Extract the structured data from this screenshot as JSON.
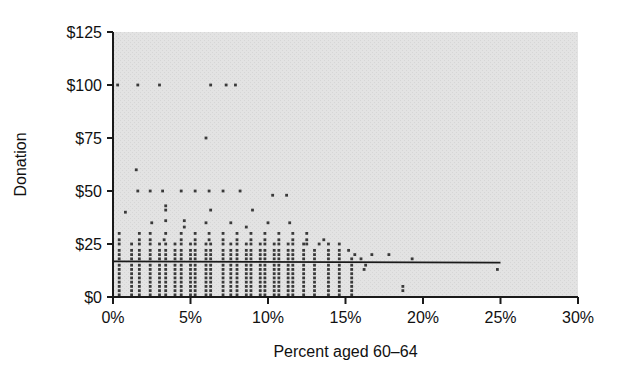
{
  "chart_data": {
    "type": "scatter",
    "title": "",
    "xlabel": "Percent aged 60–64",
    "ylabel": "Donation",
    "xlim": [
      0,
      30
    ],
    "ylim": [
      0,
      125
    ],
    "grid": false,
    "legend": "none",
    "xticks": [
      0,
      5,
      10,
      15,
      20,
      25,
      30
    ],
    "xticklabels": [
      "0%",
      "5%",
      "10%",
      "15%",
      "20%",
      "25%",
      "30%"
    ],
    "yticks": [
      0,
      25,
      50,
      75,
      100,
      125
    ],
    "yticklabels": [
      "$0",
      "$25",
      "$50",
      "$75",
      "$100",
      "$125"
    ],
    "plot_background": "#e3e3e3",
    "point_color": "#3a3a3a",
    "axis_color": "#1a1a1a",
    "trendline": {
      "label": "regression line",
      "color": "#1a1a1a",
      "x": [
        0.0,
        25.0
      ],
      "y": [
        16.8,
        16.2
      ]
    },
    "points": [
      [
        0.3,
        100
      ],
      [
        1.6,
        100
      ],
      [
        3.0,
        100
      ],
      [
        6.3,
        100
      ],
      [
        7.3,
        100
      ],
      [
        7.9,
        100
      ],
      [
        6.0,
        75
      ],
      [
        1.5,
        60
      ],
      [
        1.6,
        50
      ],
      [
        2.4,
        50
      ],
      [
        3.2,
        50
      ],
      [
        4.4,
        50
      ],
      [
        5.3,
        50
      ],
      [
        6.2,
        50
      ],
      [
        7.1,
        50
      ],
      [
        8.2,
        50
      ],
      [
        10.3,
        48
      ],
      [
        11.2,
        48
      ],
      [
        0.8,
        40
      ],
      [
        3.4,
        43
      ],
      [
        3.4,
        41
      ],
      [
        6.3,
        41
      ],
      [
        9.0,
        41
      ],
      [
        2.5,
        35
      ],
      [
        3.4,
        36
      ],
      [
        4.6,
        36
      ],
      [
        4.6,
        33
      ],
      [
        6.0,
        35
      ],
      [
        7.6,
        35
      ],
      [
        8.6,
        33
      ],
      [
        10.0,
        35
      ],
      [
        11.4,
        35
      ],
      [
        0.4,
        30
      ],
      [
        1.7,
        30
      ],
      [
        2.4,
        30
      ],
      [
        3.4,
        30
      ],
      [
        4.4,
        30
      ],
      [
        5.3,
        30
      ],
      [
        6.2,
        30
      ],
      [
        7.1,
        30
      ],
      [
        8.0,
        30
      ],
      [
        8.9,
        30
      ],
      [
        9.8,
        30
      ],
      [
        10.7,
        30
      ],
      [
        11.6,
        30
      ],
      [
        12.5,
        30
      ],
      [
        0.4,
        27
      ],
      [
        1.7,
        27
      ],
      [
        2.4,
        27
      ],
      [
        3.3,
        27
      ],
      [
        4.4,
        27
      ],
      [
        5.3,
        27
      ],
      [
        6.2,
        27
      ],
      [
        7.1,
        27
      ],
      [
        8.0,
        27
      ],
      [
        8.9,
        27
      ],
      [
        9.8,
        27
      ],
      [
        10.7,
        27
      ],
      [
        11.6,
        27
      ],
      [
        12.5,
        27
      ],
      [
        13.6,
        27
      ],
      [
        0.4,
        25
      ],
      [
        1.2,
        25
      ],
      [
        1.7,
        25
      ],
      [
        2.4,
        25
      ],
      [
        3.0,
        25
      ],
      [
        3.4,
        25
      ],
      [
        4.0,
        25
      ],
      [
        4.4,
        25
      ],
      [
        5.0,
        25
      ],
      [
        5.3,
        25
      ],
      [
        6.0,
        25
      ],
      [
        6.3,
        25
      ],
      [
        7.1,
        25
      ],
      [
        7.6,
        25
      ],
      [
        8.0,
        25
      ],
      [
        8.6,
        25
      ],
      [
        8.9,
        25
      ],
      [
        9.5,
        25
      ],
      [
        9.8,
        25
      ],
      [
        10.4,
        25
      ],
      [
        10.7,
        25
      ],
      [
        11.3,
        25
      ],
      [
        11.6,
        25
      ],
      [
        12.3,
        25
      ],
      [
        12.5,
        25
      ],
      [
        13.3,
        25
      ],
      [
        13.9,
        25
      ],
      [
        14.6,
        25
      ],
      [
        0.4,
        22
      ],
      [
        1.2,
        22
      ],
      [
        1.7,
        22
      ],
      [
        2.4,
        22
      ],
      [
        3.0,
        22
      ],
      [
        3.4,
        22
      ],
      [
        4.0,
        22
      ],
      [
        4.4,
        22
      ],
      [
        5.0,
        22
      ],
      [
        5.3,
        22
      ],
      [
        6.0,
        22
      ],
      [
        6.3,
        22
      ],
      [
        7.1,
        22
      ],
      [
        7.6,
        22
      ],
      [
        8.0,
        22
      ],
      [
        8.6,
        22
      ],
      [
        8.9,
        22
      ],
      [
        9.5,
        22
      ],
      [
        9.8,
        22
      ],
      [
        10.4,
        22
      ],
      [
        10.7,
        22
      ],
      [
        11.3,
        22
      ],
      [
        11.6,
        22
      ],
      [
        12.3,
        22
      ],
      [
        13.0,
        22
      ],
      [
        13.9,
        22
      ],
      [
        14.6,
        22
      ],
      [
        15.2,
        22
      ],
      [
        0.4,
        20
      ],
      [
        1.2,
        20
      ],
      [
        1.7,
        20
      ],
      [
        2.4,
        20
      ],
      [
        3.0,
        20
      ],
      [
        3.4,
        20
      ],
      [
        4.0,
        20
      ],
      [
        4.4,
        20
      ],
      [
        5.0,
        20
      ],
      [
        5.3,
        20
      ],
      [
        6.0,
        20
      ],
      [
        6.3,
        20
      ],
      [
        7.1,
        20
      ],
      [
        7.6,
        20
      ],
      [
        8.0,
        20
      ],
      [
        8.6,
        20
      ],
      [
        8.9,
        20
      ],
      [
        9.5,
        20
      ],
      [
        9.8,
        20
      ],
      [
        10.4,
        20
      ],
      [
        10.7,
        20
      ],
      [
        11.3,
        20
      ],
      [
        11.6,
        20
      ],
      [
        12.3,
        20
      ],
      [
        13.0,
        20
      ],
      [
        13.9,
        20
      ],
      [
        14.6,
        20
      ],
      [
        15.6,
        20
      ],
      [
        16.7,
        20
      ],
      [
        17.8,
        20
      ],
      [
        0.4,
        18
      ],
      [
        1.2,
        18
      ],
      [
        1.7,
        18
      ],
      [
        2.4,
        18
      ],
      [
        3.0,
        18
      ],
      [
        3.4,
        18
      ],
      [
        4.0,
        18
      ],
      [
        4.4,
        18
      ],
      [
        5.0,
        18
      ],
      [
        5.3,
        18
      ],
      [
        6.0,
        18
      ],
      [
        6.3,
        18
      ],
      [
        7.1,
        18
      ],
      [
        7.6,
        18
      ],
      [
        8.0,
        18
      ],
      [
        8.6,
        18
      ],
      [
        8.9,
        18
      ],
      [
        9.5,
        18
      ],
      [
        9.8,
        18
      ],
      [
        10.4,
        18
      ],
      [
        10.7,
        18
      ],
      [
        11.3,
        18
      ],
      [
        11.6,
        18
      ],
      [
        12.3,
        18
      ],
      [
        13.0,
        18
      ],
      [
        13.9,
        18
      ],
      [
        14.6,
        18
      ],
      [
        15.4,
        18
      ],
      [
        16.0,
        18
      ],
      [
        19.3,
        18
      ],
      [
        0.4,
        15
      ],
      [
        1.2,
        15
      ],
      [
        1.7,
        15
      ],
      [
        2.4,
        15
      ],
      [
        3.0,
        15
      ],
      [
        3.4,
        15
      ],
      [
        4.0,
        15
      ],
      [
        4.4,
        15
      ],
      [
        5.0,
        15
      ],
      [
        5.3,
        15
      ],
      [
        6.0,
        15
      ],
      [
        6.3,
        15
      ],
      [
        7.1,
        15
      ],
      [
        7.6,
        15
      ],
      [
        8.0,
        15
      ],
      [
        8.6,
        15
      ],
      [
        8.9,
        15
      ],
      [
        9.5,
        15
      ],
      [
        9.8,
        15
      ],
      [
        10.4,
        15
      ],
      [
        10.7,
        15
      ],
      [
        11.3,
        15
      ],
      [
        11.6,
        15
      ],
      [
        12.3,
        15
      ],
      [
        13.0,
        15
      ],
      [
        13.9,
        15
      ],
      [
        14.6,
        15
      ],
      [
        15.4,
        15
      ],
      [
        16.3,
        15
      ],
      [
        0.4,
        13
      ],
      [
        1.2,
        13
      ],
      [
        1.7,
        13
      ],
      [
        2.4,
        13
      ],
      [
        3.0,
        13
      ],
      [
        3.4,
        13
      ],
      [
        4.0,
        13
      ],
      [
        4.4,
        13
      ],
      [
        5.0,
        13
      ],
      [
        5.3,
        13
      ],
      [
        6.0,
        13
      ],
      [
        6.3,
        13
      ],
      [
        7.1,
        13
      ],
      [
        7.6,
        13
      ],
      [
        8.0,
        13
      ],
      [
        8.6,
        13
      ],
      [
        8.9,
        13
      ],
      [
        9.5,
        13
      ],
      [
        9.8,
        13
      ],
      [
        10.4,
        13
      ],
      [
        10.7,
        13
      ],
      [
        11.3,
        13
      ],
      [
        11.6,
        13
      ],
      [
        12.3,
        13
      ],
      [
        13.0,
        13
      ],
      [
        13.9,
        13
      ],
      [
        14.6,
        13
      ],
      [
        15.4,
        13
      ],
      [
        16.2,
        13
      ],
      [
        24.8,
        13
      ],
      [
        0.4,
        11
      ],
      [
        1.2,
        11
      ],
      [
        1.7,
        11
      ],
      [
        2.4,
        11
      ],
      [
        3.0,
        11
      ],
      [
        3.4,
        11
      ],
      [
        4.0,
        11
      ],
      [
        4.4,
        11
      ],
      [
        5.0,
        11
      ],
      [
        5.3,
        11
      ],
      [
        6.0,
        11
      ],
      [
        6.3,
        11
      ],
      [
        7.1,
        11
      ],
      [
        7.6,
        11
      ],
      [
        8.0,
        11
      ],
      [
        8.6,
        11
      ],
      [
        8.9,
        11
      ],
      [
        9.5,
        11
      ],
      [
        9.8,
        11
      ],
      [
        10.4,
        11
      ],
      [
        10.7,
        11
      ],
      [
        11.3,
        11
      ],
      [
        11.6,
        11
      ],
      [
        12.3,
        11
      ],
      [
        13.0,
        11
      ],
      [
        13.9,
        11
      ],
      [
        14.6,
        11
      ],
      [
        15.4,
        11
      ],
      [
        0.4,
        9
      ],
      [
        1.2,
        9
      ],
      [
        1.7,
        9
      ],
      [
        2.4,
        9
      ],
      [
        3.0,
        9
      ],
      [
        3.4,
        9
      ],
      [
        4.0,
        9
      ],
      [
        4.4,
        9
      ],
      [
        5.0,
        9
      ],
      [
        5.3,
        9
      ],
      [
        6.0,
        9
      ],
      [
        6.3,
        9
      ],
      [
        7.1,
        9
      ],
      [
        7.6,
        9
      ],
      [
        8.0,
        9
      ],
      [
        8.6,
        9
      ],
      [
        8.9,
        9
      ],
      [
        9.5,
        9
      ],
      [
        9.8,
        9
      ],
      [
        10.4,
        9
      ],
      [
        10.7,
        9
      ],
      [
        11.3,
        9
      ],
      [
        11.6,
        9
      ],
      [
        12.3,
        9
      ],
      [
        13.0,
        9
      ],
      [
        13.9,
        9
      ],
      [
        14.6,
        9
      ],
      [
        15.4,
        9
      ],
      [
        0.4,
        7
      ],
      [
        1.2,
        7
      ],
      [
        1.7,
        7
      ],
      [
        2.4,
        7
      ],
      [
        3.0,
        7
      ],
      [
        3.4,
        7
      ],
      [
        4.0,
        7
      ],
      [
        4.4,
        7
      ],
      [
        5.0,
        7
      ],
      [
        5.3,
        7
      ],
      [
        6.0,
        7
      ],
      [
        6.3,
        7
      ],
      [
        7.1,
        7
      ],
      [
        7.6,
        7
      ],
      [
        8.0,
        7
      ],
      [
        8.6,
        7
      ],
      [
        8.9,
        7
      ],
      [
        9.5,
        7
      ],
      [
        9.8,
        7
      ],
      [
        10.4,
        7
      ],
      [
        10.7,
        7
      ],
      [
        11.3,
        7
      ],
      [
        11.6,
        7
      ],
      [
        12.3,
        7
      ],
      [
        13.0,
        7
      ],
      [
        13.9,
        7
      ],
      [
        14.6,
        7
      ],
      [
        15.4,
        7
      ],
      [
        0.4,
        5
      ],
      [
        1.2,
        5
      ],
      [
        1.7,
        5
      ],
      [
        2.4,
        5
      ],
      [
        3.0,
        5
      ],
      [
        3.4,
        5
      ],
      [
        4.0,
        5
      ],
      [
        4.4,
        5
      ],
      [
        5.0,
        5
      ],
      [
        5.3,
        5
      ],
      [
        6.0,
        5
      ],
      [
        6.3,
        5
      ],
      [
        7.1,
        5
      ],
      [
        7.6,
        5
      ],
      [
        8.0,
        5
      ],
      [
        8.6,
        5
      ],
      [
        8.9,
        5
      ],
      [
        9.5,
        5
      ],
      [
        9.8,
        5
      ],
      [
        10.4,
        5
      ],
      [
        10.7,
        5
      ],
      [
        11.3,
        5
      ],
      [
        11.6,
        5
      ],
      [
        12.3,
        5
      ],
      [
        13.0,
        5
      ],
      [
        13.9,
        5
      ],
      [
        14.6,
        5
      ],
      [
        15.4,
        5
      ],
      [
        18.7,
        5
      ],
      [
        0.4,
        3
      ],
      [
        1.2,
        3
      ],
      [
        1.7,
        3
      ],
      [
        2.4,
        3
      ],
      [
        3.0,
        3
      ],
      [
        3.4,
        3
      ],
      [
        4.0,
        3
      ],
      [
        4.4,
        3
      ],
      [
        5.0,
        3
      ],
      [
        5.3,
        3
      ],
      [
        6.0,
        3
      ],
      [
        6.3,
        3
      ],
      [
        7.1,
        3
      ],
      [
        7.6,
        3
      ],
      [
        8.0,
        3
      ],
      [
        8.6,
        3
      ],
      [
        8.9,
        3
      ],
      [
        9.5,
        3
      ],
      [
        9.8,
        3
      ],
      [
        10.4,
        3
      ],
      [
        10.7,
        3
      ],
      [
        11.3,
        3
      ],
      [
        11.6,
        3
      ],
      [
        12.3,
        3
      ],
      [
        13.0,
        3
      ],
      [
        13.9,
        3
      ],
      [
        14.6,
        3
      ],
      [
        15.4,
        3
      ],
      [
        18.7,
        3
      ],
      [
        0.4,
        1
      ],
      [
        1.2,
        1
      ],
      [
        1.7,
        1
      ],
      [
        2.4,
        1
      ],
      [
        3.0,
        1
      ],
      [
        3.4,
        1
      ],
      [
        4.0,
        1
      ],
      [
        4.4,
        1
      ],
      [
        5.0,
        1
      ],
      [
        5.3,
        1
      ],
      [
        6.0,
        1
      ],
      [
        6.3,
        1
      ],
      [
        7.1,
        1
      ],
      [
        7.6,
        1
      ],
      [
        8.0,
        1
      ],
      [
        8.6,
        1
      ],
      [
        8.9,
        1
      ],
      [
        9.5,
        1
      ],
      [
        9.8,
        1
      ],
      [
        10.4,
        1
      ],
      [
        10.7,
        1
      ],
      [
        11.3,
        1
      ],
      [
        11.6,
        1
      ],
      [
        12.3,
        1
      ],
      [
        13.0,
        1
      ],
      [
        13.9,
        1
      ],
      [
        14.6,
        1
      ],
      [
        15.4,
        1
      ]
    ]
  }
}
